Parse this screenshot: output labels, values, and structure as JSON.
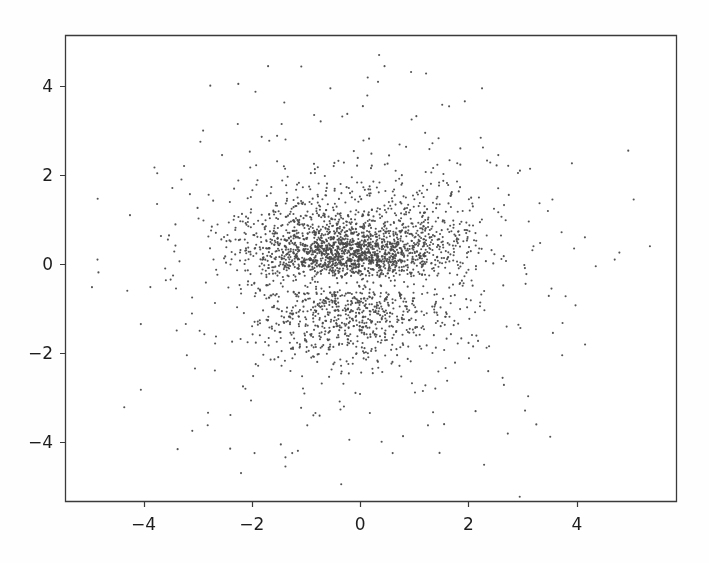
{
  "figure": {
    "background_color": "#fefefe",
    "plot_background_color": "#ffffff",
    "frame_color": "#3a3a3a",
    "tick_color": "#3a3a3a",
    "label_color": "#1d1d1d",
    "point_color": "#4a4a4a"
  },
  "chart_data": {
    "type": "scatter",
    "title": "",
    "subtitle": "",
    "xlabel": "",
    "ylabel": "",
    "xlim": [
      -5.45,
      5.85
    ],
    "ylim": [
      -5.35,
      5.15
    ],
    "xticks": [
      -4,
      -2,
      0,
      2,
      4
    ],
    "yticks": [
      -4,
      -2,
      0,
      2,
      4
    ],
    "xtick_labels": [
      "−4",
      "−2",
      "0",
      "2",
      "4"
    ],
    "ytick_labels": [
      "−4",
      "−2",
      "0",
      "2",
      "4"
    ],
    "grid": false,
    "legend": null,
    "legend_position": "none",
    "annotations": [],
    "marker": {
      "shape": "circle",
      "size_px": 2.1,
      "color": "#4a4a4a",
      "alpha": 0.95
    },
    "n_points": 3100,
    "series": [
      {
        "name": "points",
        "description": "Dense bivariate cloud centred near the origin with a bright horizontal band near y=0.2, a low-density gap near y=-0.45, and a second dense lobe near y=-1.1; broad sparse halo out to radius ~5.",
        "x_mean": -0.05,
        "y_mean": -0.15,
        "x_std": 1.05,
        "y_std": 1.15,
        "components": [
          {
            "name": "upper-band",
            "weight": 0.34,
            "mx": -0.1,
            "my": 0.28,
            "sx": 0.78,
            "sy": 0.3,
            "rot": 0.0
          },
          {
            "name": "upper-wide",
            "weight": 0.14,
            "mx": -0.25,
            "my": 0.75,
            "sx": 1.05,
            "sy": 0.55,
            "rot": 0.0
          },
          {
            "name": "lower-lobe",
            "weight": 0.24,
            "mx": -0.15,
            "my": -1.05,
            "sx": 0.82,
            "sy": 0.52,
            "rot": 0.0
          },
          {
            "name": "right-wing",
            "weight": 0.07,
            "mx": 1.25,
            "my": 0.55,
            "sx": 0.6,
            "sy": 0.75,
            "rot": 0.0
          },
          {
            "name": "left-wing",
            "weight": 0.07,
            "mx": -1.3,
            "my": 0.3,
            "sx": 0.55,
            "sy": 0.7,
            "rot": 0.0
          },
          {
            "name": "halo",
            "weight": 0.14,
            "mx": -0.1,
            "my": -0.25,
            "sx": 1.9,
            "sy": 1.85,
            "rot": 0.0
          }
        ],
        "outliers": [
          [
            -4.85,
            0.1
          ],
          [
            -4.3,
            -0.6
          ],
          [
            -4.25,
            1.1
          ],
          [
            -4.05,
            -1.35
          ],
          [
            -3.75,
            1.35
          ],
          [
            -3.6,
            -0.1
          ],
          [
            -3.55,
            0.55
          ],
          [
            -3.5,
            -0.35
          ],
          [
            -3.4,
            -0.55
          ],
          [
            -3.3,
            1.9
          ],
          [
            -3.2,
            -2.05
          ],
          [
            -3.1,
            -3.75
          ],
          [
            -3.05,
            -2.35
          ],
          [
            -2.95,
            2.75
          ],
          [
            -2.9,
            3.0
          ],
          [
            -2.55,
            2.45
          ],
          [
            -2.4,
            -4.15
          ],
          [
            -2.25,
            4.05
          ],
          [
            -2.2,
            -4.7
          ],
          [
            -1.95,
            -4.25
          ],
          [
            -1.7,
            4.45
          ],
          [
            -1.45,
            3.15
          ],
          [
            -1.15,
            -4.2
          ],
          [
            -0.85,
            3.35
          ],
          [
            -0.55,
            3.95
          ],
          [
            -0.35,
            -4.95
          ],
          [
            -0.2,
            -3.95
          ],
          [
            0.05,
            3.55
          ],
          [
            0.35,
            4.7
          ],
          [
            0.45,
            4.45
          ],
          [
            0.6,
            -4.25
          ],
          [
            0.95,
            3.25
          ],
          [
            1.2,
            2.95
          ],
          [
            1.55,
            -3.6
          ],
          [
            1.85,
            2.6
          ],
          [
            2.25,
            3.95
          ],
          [
            2.55,
            2.45
          ],
          [
            2.95,
            2.1
          ],
          [
            3.2,
            0.4
          ],
          [
            3.55,
            1.45
          ],
          [
            3.95,
            0.35
          ],
          [
            4.15,
            0.6
          ],
          [
            4.35,
            -0.05
          ],
          [
            4.7,
            0.1
          ],
          [
            4.95,
            2.55
          ],
          [
            5.05,
            1.45
          ],
          [
            5.35,
            0.4
          ]
        ]
      }
    ]
  },
  "geometry": {
    "plot_left": 65,
    "plot_right": 677,
    "plot_top": 35,
    "plot_bottom": 502,
    "tick_length": 5
  }
}
